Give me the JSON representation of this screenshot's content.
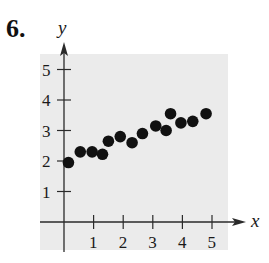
{
  "problem": {
    "number": "6."
  },
  "chart_data": {
    "type": "scatter",
    "title": "",
    "xlabel": "x",
    "ylabel": "y",
    "xlim": [
      0,
      5
    ],
    "ylim": [
      0,
      5
    ],
    "x_ticks": [
      "1",
      "2",
      "3",
      "4",
      "5"
    ],
    "y_ticks": [
      "1",
      "2",
      "3",
      "4",
      "5"
    ],
    "grid": false,
    "legend": null,
    "background_shading": "#ebebeb",
    "marker_color": "#111111",
    "points": [
      {
        "x": 0.15,
        "y": 1.95
      },
      {
        "x": 0.55,
        "y": 2.3
      },
      {
        "x": 0.95,
        "y": 2.3
      },
      {
        "x": 1.3,
        "y": 2.22
      },
      {
        "x": 1.5,
        "y": 2.65
      },
      {
        "x": 1.9,
        "y": 2.8
      },
      {
        "x": 2.3,
        "y": 2.6
      },
      {
        "x": 2.65,
        "y": 2.9
      },
      {
        "x": 3.1,
        "y": 3.15
      },
      {
        "x": 3.45,
        "y": 3.0
      },
      {
        "x": 3.6,
        "y": 3.55
      },
      {
        "x": 3.95,
        "y": 3.25
      },
      {
        "x": 4.35,
        "y": 3.3
      },
      {
        "x": 4.8,
        "y": 3.55
      }
    ]
  }
}
